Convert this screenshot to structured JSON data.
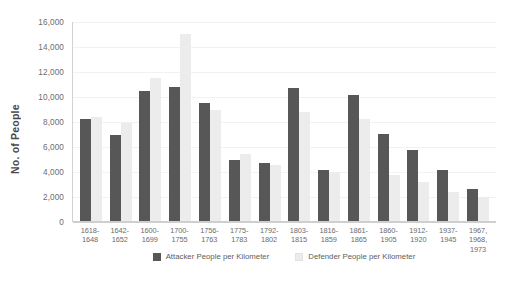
{
  "chart_data": {
    "type": "bar",
    "title": "",
    "xlabel": "",
    "ylabel": "No. of People",
    "ylim": [
      0,
      16000
    ],
    "yticks": [
      "0",
      "2,000",
      "4,000",
      "6,000",
      "8,000",
      "10,000",
      "12,000",
      "14,000",
      "16,000"
    ],
    "ytick_values": [
      0,
      2000,
      4000,
      6000,
      8000,
      10000,
      12000,
      14000,
      16000
    ],
    "grid": true,
    "legend_position": "bottom",
    "categories": [
      "1618-\n1648",
      "1642-\n1652",
      "1600-\n1699",
      "1700-\n1755",
      "1756-\n1763",
      "1775-\n1783",
      "1792-\n1802",
      "1803-\n1815",
      "1816-\n1859",
      "1861-\n1865",
      "1860-\n1905",
      "1912-\n1920",
      "1937-\n1945",
      "1967,\n1968,\n1973"
    ],
    "series": [
      {
        "name": "Attacker People per Kilometer",
        "color": "#575757",
        "values": [
          8200,
          6850,
          10400,
          10700,
          9450,
          4900,
          4650,
          10650,
          4050,
          10050,
          6950,
          5650,
          4100,
          2550
        ]
      },
      {
        "name": "Defender People per Kilometer",
        "color": "#ececec",
        "values": [
          8350,
          7850,
          11450,
          15000,
          8850,
          5400,
          4500,
          8700,
          3950,
          8150,
          3700,
          3100,
          2350,
          1900
        ]
      }
    ]
  },
  "caption": ""
}
